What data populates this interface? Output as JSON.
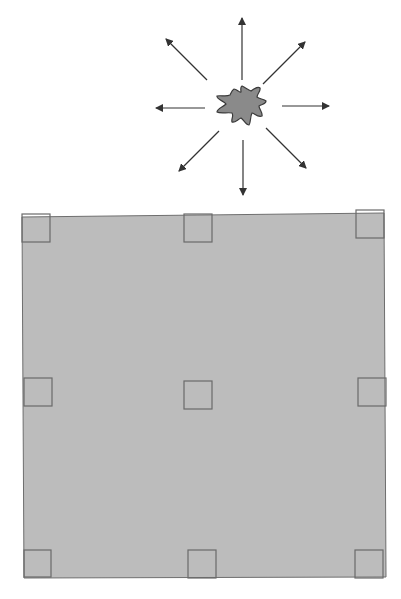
{
  "diagram": {
    "colors": {
      "background": "#ffffff",
      "plate_fill": "#bcbcbc",
      "plate_stroke": "#6e6e6e",
      "handle_stroke": "#6a6a6a",
      "blob_fill": "#8a8a8a",
      "blob_stroke": "#3a3a3a",
      "arrow": "#333333"
    },
    "burst": {
      "label": "expanding-source",
      "center": [
        242,
        105
      ],
      "arrow_count": 8,
      "arrows": [
        {
          "dir": "up",
          "from": [
            242,
            80
          ],
          "to": [
            242,
            18
          ]
        },
        {
          "dir": "up-right",
          "from": [
            263,
            84
          ],
          "to": [
            305,
            42
          ]
        },
        {
          "dir": "right",
          "from": [
            282,
            106
          ],
          "to": [
            329,
            106
          ]
        },
        {
          "dir": "down-right",
          "from": [
            266,
            128
          ],
          "to": [
            306,
            168
          ]
        },
        {
          "dir": "down",
          "from": [
            243,
            140
          ],
          "to": [
            243,
            195
          ]
        },
        {
          "dir": "down-left",
          "from": [
            219,
            131
          ],
          "to": [
            179,
            171
          ]
        },
        {
          "dir": "left",
          "from": [
            205,
            108
          ],
          "to": [
            156,
            108
          ]
        },
        {
          "dir": "up-left",
          "from": [
            207,
            80
          ],
          "to": [
            166,
            39
          ]
        }
      ]
    },
    "plate": {
      "label": "square-plate",
      "corners": [
        [
          22,
          217
        ],
        [
          384,
          213
        ],
        [
          386,
          577
        ],
        [
          24,
          578
        ]
      ]
    },
    "handles": [
      {
        "name": "handle-top-left",
        "x": 22,
        "y": 214,
        "size": 28
      },
      {
        "name": "handle-top-middle",
        "x": 184,
        "y": 214,
        "size": 28
      },
      {
        "name": "handle-top-right",
        "x": 356,
        "y": 210,
        "size": 28
      },
      {
        "name": "handle-middle-left",
        "x": 24,
        "y": 378,
        "size": 28
      },
      {
        "name": "handle-center",
        "x": 184,
        "y": 381,
        "size": 28
      },
      {
        "name": "handle-middle-right",
        "x": 358,
        "y": 378,
        "size": 28
      },
      {
        "name": "handle-bottom-left",
        "x": 24,
        "y": 550,
        "size": 27
      },
      {
        "name": "handle-bottom-middle",
        "x": 188,
        "y": 550,
        "size": 28
      },
      {
        "name": "handle-bottom-right",
        "x": 355,
        "y": 550,
        "size": 28
      }
    ]
  }
}
